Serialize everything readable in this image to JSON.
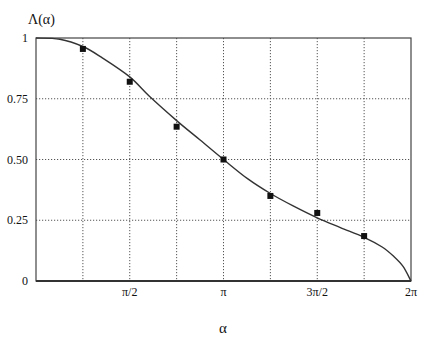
{
  "chart_data": {
    "type": "line",
    "title": "",
    "xlabel": "α",
    "ylabel": "Λ(α)",
    "xlim": [
      0,
      6.2832
    ],
    "ylim": [
      0,
      1
    ],
    "grid": true,
    "x_ticks": [
      {
        "value": 1.5708,
        "label": "π/2"
      },
      {
        "value": 3.1416,
        "label": "π"
      },
      {
        "value": 4.7124,
        "label": "3π/2"
      },
      {
        "value": 6.2832,
        "label": "2π"
      }
    ],
    "x_grid": [
      0.7854,
      1.5708,
      2.3562,
      3.1416,
      3.927,
      4.7124,
      5.4978
    ],
    "y_ticks": [
      {
        "value": 0,
        "label": "0"
      },
      {
        "value": 0.25,
        "label": "0.25"
      },
      {
        "value": 0.5,
        "label": "0.50"
      },
      {
        "value": 0.75,
        "label": "0.75"
      },
      {
        "value": 1,
        "label": "1"
      }
    ],
    "series": [
      {
        "name": "theory",
        "kind": "line",
        "x": [
          0,
          0.4,
          0.7854,
          1.1,
          1.5708,
          1.9,
          2.3562,
          2.75,
          3.1416,
          3.55,
          3.927,
          4.3,
          4.7124,
          5.1,
          5.4978,
          5.8,
          6.0,
          6.15,
          6.2832
        ],
        "values": [
          1.0,
          0.995,
          0.965,
          0.92,
          0.84,
          0.76,
          0.66,
          0.58,
          0.5,
          0.42,
          0.36,
          0.31,
          0.26,
          0.22,
          0.18,
          0.14,
          0.1,
          0.06,
          0.0
        ]
      },
      {
        "name": "data",
        "kind": "scatter",
        "marker": "square",
        "x": [
          0.7854,
          1.5708,
          2.3562,
          3.1416,
          3.927,
          4.7124,
          5.4978
        ],
        "values": [
          0.955,
          0.82,
          0.635,
          0.5,
          0.35,
          0.28,
          0.185
        ]
      }
    ],
    "legend": null
  },
  "labels": {
    "ylabel": "Λ(α)",
    "xlabel": "α"
  }
}
